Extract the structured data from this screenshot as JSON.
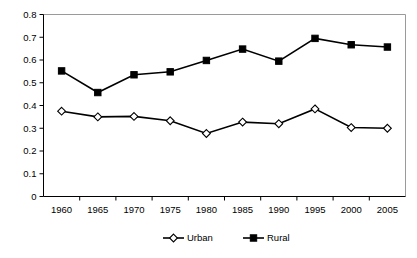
{
  "chart_data": {
    "type": "line",
    "title": "",
    "subtitle": "",
    "xlabel": "",
    "ylabel": "",
    "categories": [
      "1960",
      "1965",
      "1970",
      "1975",
      "1980",
      "1985",
      "1990",
      "1995",
      "2000",
      "2005"
    ],
    "x": [
      1960,
      1965,
      1970,
      1975,
      1980,
      1985,
      1990,
      1995,
      2000,
      2005
    ],
    "series": [
      {
        "name": "Urban",
        "marker": "open-diamond",
        "color": "#000000",
        "values": [
          0.375,
          0.35,
          0.352,
          0.333,
          0.277,
          0.327,
          0.32,
          0.385,
          0.303,
          0.3
        ]
      },
      {
        "name": "Rural",
        "marker": "filled-square",
        "color": "#000000",
        "values": [
          0.552,
          0.457,
          0.535,
          0.548,
          0.598,
          0.648,
          0.595,
          0.695,
          0.667,
          0.657
        ]
      }
    ],
    "ylim": [
      0,
      0.8
    ],
    "ytick_values": [
      0,
      0.1,
      0.2,
      0.3,
      0.4,
      0.5,
      0.6,
      0.7,
      0.8
    ],
    "ytick_labels": [
      "0",
      "0.1",
      "0.2",
      "0.3",
      "0.4",
      "0.5",
      "0.6",
      "0.7",
      "0.8"
    ],
    "xtick_labels": [
      "1960",
      "1965",
      "1970",
      "1975",
      "1980",
      "1985",
      "1990",
      "1995",
      "2000",
      "2005"
    ],
    "grid": false,
    "legend_position": "bottom",
    "legend_entries": [
      "Urban",
      "Rural"
    ]
  }
}
